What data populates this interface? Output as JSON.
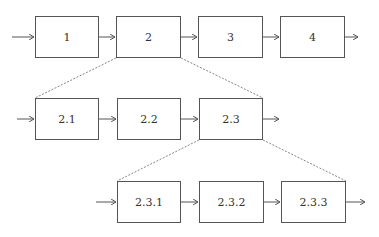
{
  "diagram": {
    "type": "hierarchical-process-decomposition",
    "colors": {
      "stroke": "#555555",
      "text": "#333333",
      "background": "#ffffff"
    },
    "levels": [
      {
        "name": "level-1",
        "boxes": [
          {
            "id": "1",
            "label": "1",
            "x": 35,
            "y": 16,
            "w": 64,
            "h": 42
          },
          {
            "id": "2",
            "label": "2",
            "x": 116,
            "y": 16,
            "w": 65,
            "h": 42
          },
          {
            "id": "3",
            "label": "3",
            "x": 198,
            "y": 16,
            "w": 65,
            "h": 42
          },
          {
            "id": "4",
            "label": "4",
            "x": 280,
            "y": 16,
            "w": 65,
            "h": 42
          }
        ]
      },
      {
        "name": "level-2",
        "parent": "2",
        "boxes": [
          {
            "id": "2.1",
            "label": "2.1",
            "x": 35,
            "y": 98,
            "w": 64,
            "h": 42
          },
          {
            "id": "2.2",
            "label": "2.2",
            "x": 117,
            "y": 98,
            "w": 64,
            "h": 42
          },
          {
            "id": "2.3",
            "label": "2.3",
            "x": 199,
            "y": 98,
            "w": 64,
            "h": 42
          }
        ]
      },
      {
        "name": "level-3",
        "parent": "2.3",
        "boxes": [
          {
            "id": "2.3.1",
            "label": "2.3.1",
            "x": 117,
            "y": 181,
            "w": 64,
            "h": 42
          },
          {
            "id": "2.3.2",
            "label": "2.3.2",
            "x": 199,
            "y": 181,
            "w": 65,
            "h": 42
          },
          {
            "id": "2.3.3",
            "label": "2.3.3",
            "x": 281,
            "y": 181,
            "w": 65,
            "h": 42
          }
        ]
      }
    ]
  }
}
